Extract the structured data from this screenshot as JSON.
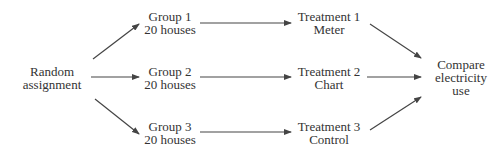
{
  "diagram": {
    "source": {
      "line1": "Random",
      "line2": "assignment"
    },
    "groups": [
      {
        "line1": "Group 1",
        "line2": "20 houses"
      },
      {
        "line1": "Group 2",
        "line2": "20 houses"
      },
      {
        "line1": "Group 3",
        "line2": "20 houses"
      }
    ],
    "treatments": [
      {
        "line1": "Treatment 1",
        "line2": "Meter"
      },
      {
        "line1": "Treatment 2",
        "line2": "Chart"
      },
      {
        "line1": "Treatment 3",
        "line2": "Control"
      }
    ],
    "outcome": {
      "line1": "Compare",
      "line2": "electricity",
      "line3": "use"
    },
    "colors": {
      "text": "#333333",
      "arrow": "#444444",
      "background": "#ffffff"
    }
  }
}
